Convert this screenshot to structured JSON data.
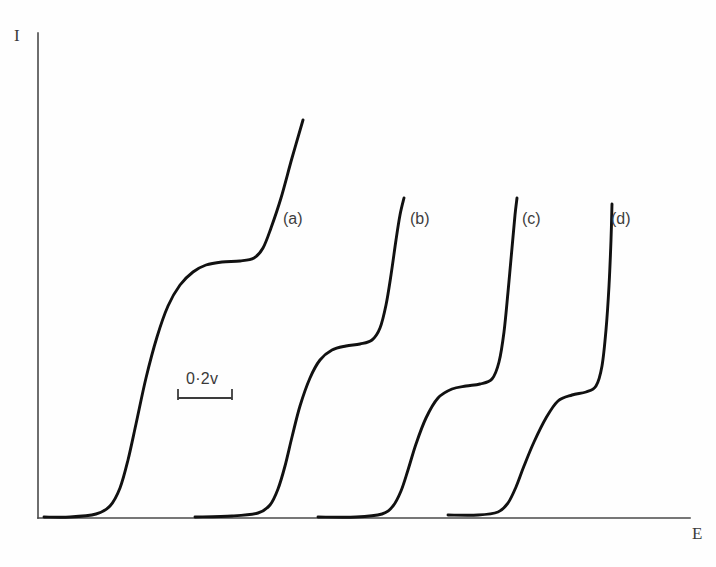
{
  "figure": {
    "background_color": "#fefefe",
    "curve_color": "#111111",
    "axis_color": "#4a4a4a",
    "text_color": "#3a3a3a"
  },
  "axes": {
    "y_label": "I",
    "x_label": "E",
    "y_axis_x": 38,
    "y_axis_top": 33,
    "y_axis_bottom": 518,
    "x_axis_left": 38,
    "x_axis_right": 690,
    "x_axis_y": 518
  },
  "scale_bar": {
    "label": "0·2v",
    "x_start": 178,
    "x_end": 232,
    "y": 398,
    "tick_height": 9,
    "text_x": 186,
    "text_y": 370
  },
  "curve_labels": [
    {
      "text": "(a)",
      "x": 283,
      "y": 210
    },
    {
      "text": "(b)",
      "x": 410,
      "y": 210
    },
    {
      "text": "(c)",
      "x": 522,
      "y": 210
    },
    {
      "text": "(d)",
      "x": 611,
      "y": 210
    }
  ],
  "chart_data": {
    "type": "line",
    "title": "",
    "xlabel": "E",
    "ylabel": "I",
    "grid": false,
    "legend": "inline-curve-labels",
    "x_axis_range_note": "potential E increasing to the right; no numeric ticks, only a 0·2v scale bar",
    "y_axis_range_note": "current I increasing upward; no numeric ticks",
    "scale_bar_value": "0·2v",
    "series": [
      {
        "name": "(a)",
        "baseline_start_x": 44,
        "liftoff_x": 112,
        "first_wave_top_y": 262,
        "plateau_x_range": [
          205,
          258
        ],
        "second_rise_x": 262,
        "top_point": [
          303,
          120
        ],
        "first_wave_height_rel": 1.0,
        "points": [
          [
            44,
            517
          ],
          [
            70,
            517
          ],
          [
            96,
            514
          ],
          [
            110,
            506
          ],
          [
            120,
            488
          ],
          [
            128,
            460
          ],
          [
            136,
            424
          ],
          [
            146,
            378
          ],
          [
            157,
            337
          ],
          [
            168,
            306
          ],
          [
            180,
            285
          ],
          [
            193,
            272
          ],
          [
            206,
            265
          ],
          [
            222,
            262
          ],
          [
            240,
            261
          ],
          [
            254,
            258
          ],
          [
            263,
            248
          ],
          [
            271,
            228
          ],
          [
            281,
            198
          ],
          [
            292,
            158
          ],
          [
            303,
            120
          ]
        ]
      },
      {
        "name": "(b)",
        "baseline_start_x": 195,
        "liftoff_x": 268,
        "first_wave_top_y": 345,
        "plateau_x_range": [
          330,
          372
        ],
        "second_rise_x": 378,
        "top_point": [
          404,
          198
        ],
        "first_wave_height_rel": 0.72,
        "points": [
          [
            195,
            517
          ],
          [
            232,
            516
          ],
          [
            258,
            513
          ],
          [
            270,
            505
          ],
          [
            278,
            489
          ],
          [
            285,
            466
          ],
          [
            292,
            437
          ],
          [
            300,
            406
          ],
          [
            310,
            378
          ],
          [
            320,
            360
          ],
          [
            332,
            350
          ],
          [
            346,
            346
          ],
          [
            360,
            344
          ],
          [
            372,
            340
          ],
          [
            380,
            328
          ],
          [
            386,
            305
          ],
          [
            391,
            275
          ],
          [
            396,
            240
          ],
          [
            400,
            215
          ],
          [
            404,
            198
          ]
        ]
      },
      {
        "name": "(c)",
        "baseline_start_x": 318,
        "liftoff_x": 392,
        "first_wave_top_y": 385,
        "plateau_x_range": [
          452,
          490
        ],
        "second_rise_x": 495,
        "top_point": [
          517,
          198
        ],
        "first_wave_height_rel": 0.55,
        "points": [
          [
            318,
            517
          ],
          [
            356,
            517
          ],
          [
            382,
            514
          ],
          [
            393,
            506
          ],
          [
            401,
            491
          ],
          [
            408,
            470
          ],
          [
            416,
            444
          ],
          [
            426,
            418
          ],
          [
            438,
            398
          ],
          [
            452,
            389
          ],
          [
            466,
            386
          ],
          [
            480,
            384
          ],
          [
            492,
            379
          ],
          [
            499,
            362
          ],
          [
            504,
            332
          ],
          [
            508,
            292
          ],
          [
            512,
            248
          ],
          [
            515,
            215
          ],
          [
            517,
            198
          ]
        ]
      },
      {
        "name": "(d)",
        "baseline_start_x": 448,
        "liftoff_x": 505,
        "first_wave_top_y": 392,
        "plateau_x_range": [
          558,
          592
        ],
        "second_rise_x": 596,
        "top_point": [
          612,
          204
        ],
        "first_wave_height_rel": 0.48,
        "points": [
          [
            448,
            515
          ],
          [
            478,
            515
          ],
          [
            498,
            512
          ],
          [
            508,
            503
          ],
          [
            516,
            487
          ],
          [
            524,
            466
          ],
          [
            534,
            442
          ],
          [
            546,
            418
          ],
          [
            558,
            401
          ],
          [
            572,
            395
          ],
          [
            586,
            392
          ],
          [
            596,
            386
          ],
          [
            602,
            366
          ],
          [
            606,
            330
          ],
          [
            609,
            286
          ],
          [
            611,
            240
          ],
          [
            612,
            204
          ]
        ]
      }
    ]
  }
}
